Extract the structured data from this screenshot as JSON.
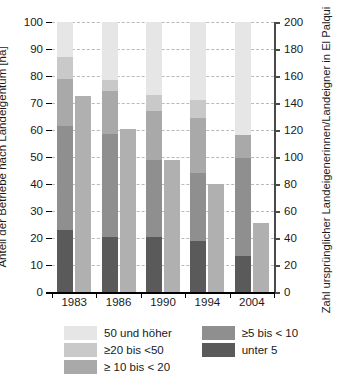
{
  "chart_data": {
    "type": "bar",
    "title": "",
    "subtitle": "",
    "categories": [
      "1983",
      "1986",
      "1990",
      "1994",
      "2004"
    ],
    "xlabel": "",
    "ylabel": "Anteil der Betriebe nach Landeigentum [ha]",
    "ylabel_right": "Zahl ursprünglicher Landeigenerinnen/Landeigner in El Palqui",
    "ylim": [
      0,
      100
    ],
    "ylim_right": [
      0,
      200
    ],
    "yticks": [
      0,
      10,
      20,
      30,
      40,
      50,
      60,
      70,
      80,
      90,
      100
    ],
    "yticks_right": [
      0,
      20,
      40,
      60,
      80,
      100,
      120,
      140,
      160,
      180,
      200
    ],
    "grid": true,
    "legend_position": "bottom",
    "stacked": true,
    "series": [
      {
        "name": "unter 5",
        "axis": "left",
        "color": "#5a5a5a",
        "values": [
          23.0,
          20.5,
          20.5,
          19.0,
          13.5
        ]
      },
      {
        "name": "≥ 5 bis < 10",
        "axis": "left",
        "color": "#8f8f8f",
        "values": [
          38.5,
          38.0,
          28.5,
          25.0,
          36.0
        ]
      },
      {
        "name": "≥ 10 bis < 20",
        "axis": "left",
        "color": "#a9a9a9",
        "values": [
          17.5,
          16.0,
          18.0,
          20.5,
          8.5
        ]
      },
      {
        "name": "≥20 bis <50",
        "axis": "left",
        "color": "#c9c9c9",
        "values": [
          8.0,
          4.0,
          6.0,
          6.5,
          0.0
        ]
      },
      {
        "name": "50 und höher",
        "axis": "left",
        "color": "#e6e6e6",
        "values": [
          13.0,
          21.5,
          27.0,
          29.0,
          42.0
        ]
      },
      {
        "name": "Zahl ursprünglicher Landeigenerinnen/Landeigner",
        "axis": "right",
        "color": "#b0b0b0",
        "values": [
          145,
          121,
          98,
          80,
          51
        ]
      }
    ],
    "stack_cumulative_tops": {
      "1983": [
        23.0,
        61.5,
        79.0,
        87.0,
        100.0
      ],
      "1986": [
        20.5,
        58.5,
        74.5,
        78.5,
        100.0
      ],
      "1990": [
        20.5,
        49.0,
        67.0,
        73.0,
        100.0
      ],
      "1994": [
        19.0,
        44.0,
        64.5,
        71.0,
        100.0
      ],
      "2004": [
        13.5,
        49.5,
        58.0,
        58.0,
        100.0
      ]
    }
  },
  "axes": {
    "left": {
      "title": "Anteil der Betriebe nach Landeigentum [ha]",
      "ticks": [
        "0",
        "10",
        "20",
        "30",
        "40",
        "50",
        "60",
        "70",
        "80",
        "90",
        "100"
      ]
    },
    "right": {
      "title": "Zahl ursprünglicher Landeigenerinnen/Landeigner in El Palqui",
      "ticks": [
        "0",
        "20",
        "40",
        "60",
        "80",
        "100",
        "120",
        "140",
        "160",
        "180",
        "200"
      ]
    },
    "bottom": {
      "ticks": [
        "1983",
        "1986",
        "1990",
        "1994",
        "2004"
      ]
    }
  },
  "legend": {
    "column_left": [
      {
        "label": "50 und höher",
        "color": "#e6e6e6",
        "icon": "legend-swatch"
      },
      {
        "label": "≥20 bis <50",
        "color": "#c9c9c9",
        "icon": "legend-swatch"
      },
      {
        "label": "≥ 10 bis < 20",
        "color": "#a9a9a9",
        "icon": "legend-swatch"
      }
    ],
    "column_right": [
      {
        "label": "≥5 bis < 10",
        "color": "#8f8f8f",
        "icon": "legend-swatch"
      },
      {
        "label": "unter 5",
        "color": "#5a5a5a",
        "icon": "legend-swatch"
      }
    ]
  },
  "colors": {
    "background": "#ffffff",
    "axis": "#000000",
    "axis_right": "#4a4a4a",
    "grid": "#b9b9b9",
    "count_bar": "#b0b0b0",
    "text": "#1a1a1a"
  }
}
